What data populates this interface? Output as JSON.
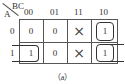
{
  "kmap": {
    "row_variable": "A",
    "col_variable": "BC",
    "col_headers": [
      "00",
      "01",
      "11",
      "10"
    ],
    "row_headers": [
      "0",
      "1"
    ],
    "cells": [
      [
        "0",
        "0",
        "×",
        "1"
      ],
      [
        "1",
        "0",
        "×",
        "1"
      ]
    ],
    "groups": [
      {
        "cells": "A=1, BC=00 (wraps to BC=10)"
      },
      {
        "cells": "A=0, BC=10"
      },
      {
        "cells": "A=1, BC=10 (wraps to BC=00)"
      }
    ],
    "caption": "（a）"
  }
}
